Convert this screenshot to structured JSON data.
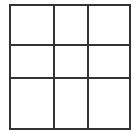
{
  "grid": {
    "rows": 3,
    "cols": 3,
    "line_color": "#333333",
    "background": "#ffffff",
    "x_lines": [
      10,
      54,
      88,
      130
    ],
    "y_lines": [
      5,
      45,
      78,
      129
    ],
    "cells": [
      [
        "",
        "",
        ""
      ],
      [
        "",
        "",
        ""
      ],
      [
        "",
        "",
        ""
      ]
    ]
  }
}
